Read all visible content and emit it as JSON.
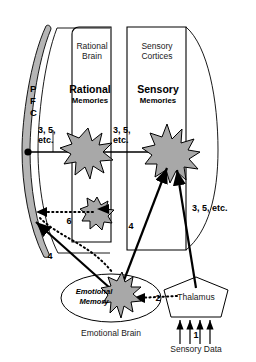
{
  "figure": {
    "background_color": "#ffffff",
    "stroke_color": "#000000",
    "shape_fill": "#a8a8a8",
    "region_fill": "#ffffff"
  },
  "regions": {
    "pfc": {
      "label_letters": [
        "P",
        "F",
        "C"
      ],
      "name": "PFC",
      "fill": "#b5b5b5"
    },
    "rational_brain": {
      "title_line1": "Rational",
      "title_line2": "Brain"
    },
    "sensory_cortices": {
      "title_line1": "Sensory",
      "title_line2": "Cortices"
    },
    "emotional_brain": {
      "title": "Emotional Brain"
    }
  },
  "nodes": {
    "rational_memories": {
      "title": "Rational",
      "subtitle": "Memories"
    },
    "sensory_memories": {
      "title": "Sensory",
      "subtitle": "Memories"
    },
    "emotional_memory": {
      "line1": "Emotional",
      "line2": "Memory"
    },
    "thalamus": {
      "label": "Thalamus"
    },
    "sensory_data": {
      "label": "Sensory Data"
    }
  },
  "edge_labels": {
    "pfc_to_rational": "3, 5,\netc.",
    "rational_to_sensory": "3, 5,\netc.",
    "sensory_right": "3, 5, etc.",
    "emotional_to_sensory": "4",
    "emotional_to_pfc": "4",
    "thalamus_to_emotional": "2",
    "rational_small_to_pfc": "6",
    "sensory_data_input": "1"
  }
}
